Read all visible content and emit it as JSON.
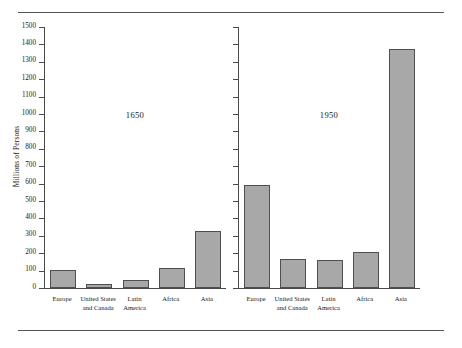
{
  "chart_data": {
    "type": "bar",
    "title": "",
    "xlabel": "",
    "ylabel": "Millions of Persons",
    "ylim": [
      0,
      1500
    ],
    "ytick_step": 100,
    "yticks": [
      0,
      100,
      200,
      300,
      400,
      500,
      600,
      700,
      800,
      900,
      1000,
      1100,
      1200,
      1300,
      1400,
      1500
    ],
    "grid": false,
    "legend": "none",
    "categories": [
      "Europe",
      "United States\nand Canada",
      "Latin\nAmerica",
      "Africa",
      "Asia"
    ],
    "panels": [
      {
        "name": "1650",
        "label": "1650",
        "values": [
          105,
          25,
          45,
          115,
          325
        ]
      },
      {
        "name": "1950",
        "label": "1950",
        "values": [
          590,
          165,
          162,
          205,
          1375
        ]
      }
    ],
    "series": [
      {
        "name": "1650",
        "values": [
          105,
          25,
          45,
          115,
          325
        ]
      },
      {
        "name": "1950",
        "values": [
          590,
          165,
          162,
          205,
          1375
        ]
      }
    ],
    "colors": {
      "bar_fill": "#a8a8a8",
      "bar_stroke": "#4f4f4f",
      "axis": "#4a4a4a",
      "rule": "#555555",
      "text": "#1a1a1a",
      "background": "#ffffff"
    }
  }
}
